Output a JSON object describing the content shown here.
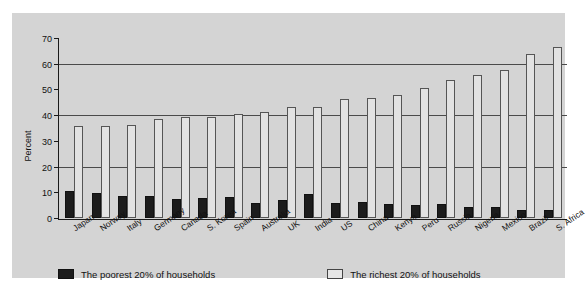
{
  "chart_data": {
    "type": "bar",
    "title": "",
    "xlabel": "",
    "ylabel": "Percent",
    "ylim": [
      0,
      70
    ],
    "yticks": [
      0,
      10,
      20,
      30,
      40,
      50,
      60,
      70
    ],
    "gridlines": [
      20,
      40,
      60
    ],
    "grid": true,
    "legend_position": "bottom",
    "categories": [
      "Japan",
      "Norway",
      "Italy",
      "Germany",
      "Canada",
      "S. Korea",
      "Spain",
      "Australia",
      "UK",
      "India",
      "US",
      "China",
      "Kenya",
      "Peru",
      "Russia",
      "Nigeria",
      "Mexico",
      "Brazil",
      "S. Africa"
    ],
    "series": [
      {
        "name": "The poorest 20% of households",
        "color": "#1c1c1c",
        "values": [
          10.6,
          9.6,
          8.7,
          8.5,
          7.5,
          7.9,
          8.0,
          5.9,
          7.1,
          9.2,
          5.8,
          6.2,
          5.6,
          4.9,
          5.3,
          4.4,
          4.1,
          3.2,
          3.3
        ]
      },
      {
        "name": "The richest 20% of households",
        "color": "#e2e2e2",
        "values": [
          35.7,
          35.8,
          36.3,
          38.5,
          39.3,
          39.3,
          40.3,
          41.3,
          43.2,
          43.3,
          46.4,
          46.6,
          47.7,
          50.4,
          53.7,
          55.7,
          57.4,
          63.8,
          66.5
        ]
      }
    ]
  },
  "legend": {
    "items": [
      {
        "label": "The poorest 20% of households",
        "swatch": "dark"
      },
      {
        "label": "The richest 20% of households",
        "swatch": "light"
      }
    ]
  },
  "axis": {
    "y_title": "Percent",
    "y_tick_labels": [
      "0",
      "10",
      "20",
      "30",
      "40",
      "50",
      "60",
      "70"
    ]
  }
}
